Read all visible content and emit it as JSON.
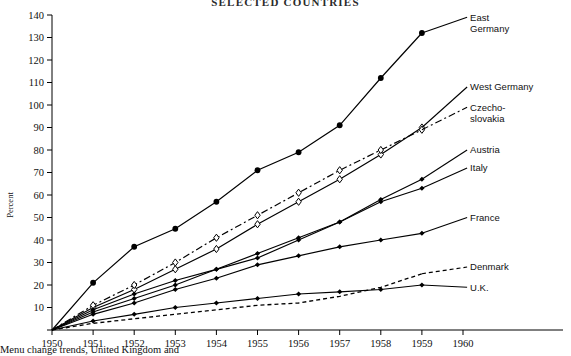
{
  "title": "SELECTED COUNTRIES",
  "caption": "Menu change trends, United Kingdom and",
  "axes": {
    "ylabel": "Percent",
    "yticks": [
      0,
      10,
      20,
      30,
      40,
      50,
      60,
      70,
      80,
      90,
      100,
      110,
      120,
      130,
      140
    ],
    "ytick_labels": [
      "",
      "10",
      "20",
      "30",
      "40",
      "50",
      "60",
      "70",
      "80",
      "90",
      "100",
      "110",
      "120",
      "130",
      "140"
    ],
    "xticks": [
      1950,
      1951,
      1952,
      1953,
      1954,
      1955,
      1956,
      1957,
      1958,
      1959,
      1960
    ],
    "xtick_labels": [
      "1950",
      "1951",
      "1952",
      "1953",
      "1954",
      "1955",
      "1956",
      "1957",
      "1958",
      "1959",
      "1960"
    ],
    "xlim": [
      1950,
      1960
    ],
    "ylim": [
      0,
      140
    ]
  },
  "chart_data": {
    "type": "line",
    "title": "SELECTED COUNTRIES",
    "xlabel": "",
    "ylabel": "Percent",
    "xlim": [
      1950,
      1960
    ],
    "ylim": [
      0,
      140
    ],
    "grid": false,
    "legend_position": "right-inline-labels",
    "x": [
      1950,
      1951,
      1952,
      1953,
      1954,
      1955,
      1956,
      1957,
      1958,
      1959
    ],
    "series": [
      {
        "name": "East Germany",
        "label": "East Germany",
        "line_style": "solid",
        "marker": "filled-circle",
        "values": [
          0,
          21,
          37,
          45,
          57,
          71,
          79,
          91,
          112,
          132
        ],
        "label_x": 1960.1,
        "label_y": 139
      },
      {
        "name": "West Germany",
        "label": "West Germany",
        "line_style": "solid",
        "marker": "open-diamond",
        "values": [
          0,
          10,
          18,
          27,
          36,
          47,
          57,
          67,
          78,
          90
        ],
        "label_x": 1960.1,
        "label_y": 108
      },
      {
        "name": "Czechoslovakia",
        "label": "Czecho-\nslovakia",
        "label_line1": "Czecho-",
        "label_line2": "slovakia",
        "line_style": "dash-dot",
        "marker": "open-diamond",
        "values": [
          0,
          11,
          20,
          30,
          41,
          51,
          61,
          71,
          80,
          89
        ],
        "label_x": 1960.1,
        "label_y": 99
      },
      {
        "name": "Austria",
        "label": "Austria",
        "line_style": "solid",
        "marker": "filled-diamond",
        "values": [
          0,
          8,
          14,
          20,
          27,
          34,
          41,
          48,
          58,
          67
        ],
        "label_x": 1960.1,
        "label_y": 80
      },
      {
        "name": "Italy",
        "label": "Italy",
        "line_style": "solid",
        "marker": "filled-diamond",
        "values": [
          0,
          9,
          16,
          22,
          27,
          32,
          40,
          48,
          57,
          63
        ],
        "label_x": 1960.1,
        "label_y": 72
      },
      {
        "name": "France",
        "label": "France",
        "line_style": "solid",
        "marker": "filled-diamond",
        "values": [
          0,
          7,
          12,
          18,
          23,
          29,
          33,
          37,
          40,
          43
        ],
        "label_x": 1960.1,
        "label_y": 50
      },
      {
        "name": "Denmark",
        "label": "Denmark",
        "line_style": "dashed",
        "marker": "none",
        "values": [
          0,
          3,
          5,
          7,
          9,
          11,
          12,
          15,
          19,
          25
        ],
        "label_x": 1960.1,
        "label_y": 28
      },
      {
        "name": "U.K.",
        "label": "U.K.",
        "line_style": "solid",
        "marker": "filled-diamond",
        "values": [
          0,
          4,
          7,
          10,
          12,
          14,
          16,
          17,
          18,
          20
        ],
        "label_x": 1960.1,
        "label_y": 19
      }
    ]
  }
}
